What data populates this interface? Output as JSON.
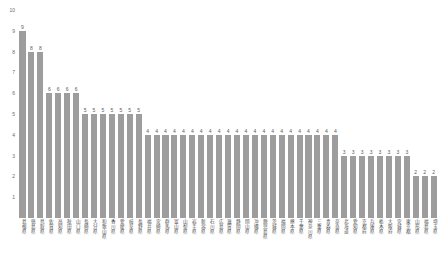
{
  "chart_data": {
    "type": "bar",
    "title": "",
    "xlabel": "",
    "ylabel": "",
    "ylim": [
      0,
      10
    ],
    "grid": false,
    "legend": false,
    "yticks": [
      10,
      9,
      8,
      7,
      6,
      5,
      4,
      3,
      2,
      1
    ],
    "categories": [
      "島根県",
      "徳島県",
      "鳥取県",
      "佐賀県",
      "高知県",
      "秋田県",
      "山口県",
      "長崎県",
      "大分県",
      "和歌山県",
      "香川県",
      "愛媛県",
      "岐阜県",
      "長野県",
      "福井県",
      "宮崎県",
      "群馬県",
      "富山県",
      "山梨県",
      "岩手県",
      "新潟県",
      "石川県",
      "広島県",
      "滋賀県",
      "静岡県",
      "岡山県",
      "沖縄県",
      "鹿児島県",
      "茨城県",
      "福岡県",
      "熊本県",
      "千葉県",
      "神奈川県",
      "三重県",
      "青森県",
      "奈良県",
      "北海道",
      "愛知県",
      "京都府",
      "兵庫県",
      "栃木県",
      "大阪府",
      "宮城県",
      "東京都",
      "山形県",
      "福島県",
      "埼玉県"
    ],
    "values": [
      9,
      8,
      8,
      6,
      6,
      6,
      6,
      5,
      5,
      5,
      5,
      5,
      5,
      5,
      4,
      4,
      4,
      4,
      4,
      4,
      4,
      4,
      4,
      4,
      4,
      4,
      4,
      4,
      4,
      4,
      4,
      4,
      4,
      4,
      4,
      4,
      3,
      3,
      3,
      3,
      3,
      3,
      3,
      3,
      2,
      2,
      2
    ]
  }
}
